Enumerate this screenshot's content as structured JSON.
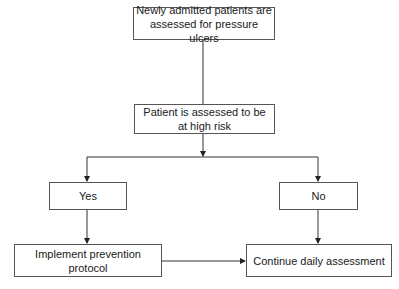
{
  "diagram": {
    "type": "flowchart",
    "colors": {
      "line": "#333333",
      "box_border": "#555555",
      "text": "#1a1a1a",
      "background": "#ffffff"
    },
    "nodes": {
      "admitted": {
        "label": "Newly admitted patients are assessed for pressure ulcers"
      },
      "high_risk": {
        "label": "Patient is assessed to be at high risk"
      },
      "yes": {
        "label": "Yes"
      },
      "no": {
        "label": "No"
      },
      "prevention": {
        "label": "Implement prevention protocol"
      },
      "continue": {
        "label": "Continue daily assessment"
      }
    },
    "edges": [
      {
        "from": "admitted",
        "to": "high_risk"
      },
      {
        "from": "high_risk",
        "to": "yes"
      },
      {
        "from": "high_risk",
        "to": "no"
      },
      {
        "from": "yes",
        "to": "prevention"
      },
      {
        "from": "no",
        "to": "continue"
      },
      {
        "from": "prevention",
        "to": "continue"
      }
    ]
  }
}
